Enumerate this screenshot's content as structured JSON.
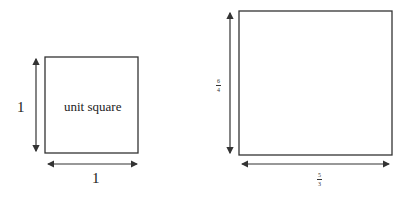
{
  "diagram": {
    "left_figure": {
      "shape": "square",
      "inside_label": "unit square",
      "height_label": "1",
      "width_label": "1"
    },
    "right_figure": {
      "shape": "rectangle",
      "inside_label": "",
      "height_label": {
        "numerator": "6",
        "denominator": "4"
      },
      "width_label": {
        "numerator": "5",
        "denominator": "3"
      }
    },
    "colors": {
      "stroke": "#333333",
      "background": "#ffffff"
    }
  }
}
